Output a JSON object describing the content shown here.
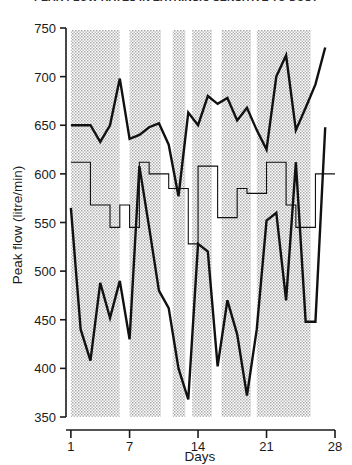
{
  "chart_data": {
    "type": "line",
    "title": "PEAK FLOW RATES IN EXTRINSIC SENSITIVE TO DUST",
    "xlabel": "Days",
    "ylabel": "Peak flow (litre/min)",
    "xlim": [
      0.5,
      28
    ],
    "ylim": [
      350,
      750
    ],
    "xticks": [
      1,
      7,
      14,
      21,
      28
    ],
    "yticks": [
      350,
      400,
      450,
      500,
      550,
      600,
      650,
      700,
      750
    ],
    "grid": false,
    "legend": "none",
    "x": [
      1,
      2,
      3,
      4,
      5,
      6,
      7,
      8,
      9,
      10,
      11,
      12,
      13,
      14,
      15,
      16,
      17,
      18,
      19,
      20,
      21,
      22,
      23,
      24,
      25,
      26,
      27
    ],
    "series": [
      {
        "name": "Maximum peak flow",
        "style": "thick-line",
        "values": [
          650,
          650,
          650,
          633,
          650,
          698,
          636,
          640,
          648,
          652,
          630,
          577,
          663,
          650,
          680,
          672,
          678,
          655,
          668,
          645,
          625,
          700,
          722,
          645,
          668,
          692,
          730
        ]
      },
      {
        "name": "Mean peak flow",
        "style": "thin-step",
        "values": [
          612,
          612,
          568,
          568,
          545,
          568,
          545,
          612,
          600,
          600,
          585,
          585,
          528,
          608,
          608,
          555,
          555,
          585,
          580,
          580,
          612,
          612,
          568,
          545,
          545,
          600,
          600
        ]
      },
      {
        "name": "Minimum peak flow",
        "style": "thick-line",
        "values": [
          565,
          440,
          408,
          488,
          452,
          490,
          430,
          608,
          545,
          480,
          462,
          400,
          368,
          528,
          520,
          402,
          470,
          435,
          372,
          440,
          552,
          560,
          470,
          612,
          448,
          448,
          648
        ]
      }
    ],
    "shaded_bands": [
      {
        "start": 1.0,
        "end": 6.0
      },
      {
        "start": 7.0,
        "end": 10.2
      },
      {
        "start": 11.4,
        "end": 12.7
      },
      {
        "start": 13.4,
        "end": 15.4
      },
      {
        "start": 16.4,
        "end": 19.4
      },
      {
        "start": 20.0,
        "end": 25.5
      }
    ],
    "band_color": "#d5d5d5",
    "line_color": "#111111"
  }
}
